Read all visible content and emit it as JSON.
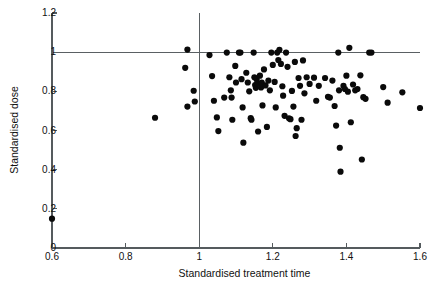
{
  "chart_data": {
    "type": "scatter",
    "title": "",
    "xlabel": "Standardised treatment time",
    "ylabel": "Standardised dose",
    "xlim": [
      0.6,
      1.6
    ],
    "ylim": [
      0,
      1.2
    ],
    "xticks": [
      "0.6",
      "0.8",
      "1",
      "1.2",
      "1.4",
      "1.6"
    ],
    "xtick_values": [
      0.6,
      0.8,
      1.0,
      1.2,
      1.4,
      1.6
    ],
    "yticks": [
      "0",
      "0.2",
      "0.4",
      "0.6",
      "0.8",
      "1",
      "1.2"
    ],
    "ytick_values": [
      0,
      0.2,
      0.4,
      0.6,
      0.8,
      1.0,
      1.2
    ],
    "grid": false,
    "legend": "none",
    "reference_lines": [
      {
        "name": "vertical-reference-line",
        "axis": "x",
        "value": 1.0
      },
      {
        "name": "horizontal-reference-line",
        "axis": "y",
        "value": 1.0
      }
    ],
    "marker": {
      "shape": "circle",
      "color": "#0a0a0a",
      "size": 3.1
    },
    "points": [
      [
        0.6,
        0.15
      ],
      [
        0.88,
        0.665
      ],
      [
        0.962,
        0.92
      ],
      [
        0.968,
        1.013
      ],
      [
        0.968,
        0.722
      ],
      [
        0.985,
        0.803
      ],
      [
        0.988,
        0.748
      ],
      [
        1.028,
        0.985
      ],
      [
        1.035,
        0.878
      ],
      [
        1.04,
        0.752
      ],
      [
        1.048,
        0.667
      ],
      [
        1.052,
        0.597
      ],
      [
        1.068,
        0.768
      ],
      [
        1.075,
        0.998
      ],
      [
        1.082,
        0.872
      ],
      [
        1.086,
        0.805
      ],
      [
        1.088,
        0.768
      ],
      [
        1.09,
        0.655
      ],
      [
        1.098,
        0.93
      ],
      [
        1.1,
        0.845
      ],
      [
        1.108,
        0.998
      ],
      [
        1.112,
        0.998
      ],
      [
        1.115,
        0.862
      ],
      [
        1.118,
        0.718
      ],
      [
        1.12,
        0.538
      ],
      [
        1.128,
        0.895
      ],
      [
        1.132,
        0.845
      ],
      [
        1.136,
        0.8
      ],
      [
        1.14,
        0.663
      ],
      [
        1.142,
        0.655
      ],
      [
        1.148,
        0.998
      ],
      [
        1.15,
        0.872
      ],
      [
        1.152,
        0.832
      ],
      [
        1.154,
        0.818
      ],
      [
        1.156,
        0.862
      ],
      [
        1.158,
        0.842
      ],
      [
        1.16,
        0.595
      ],
      [
        1.165,
        0.88
      ],
      [
        1.168,
        0.82
      ],
      [
        1.17,
        0.845
      ],
      [
        1.172,
        0.728
      ],
      [
        1.176,
        0.912
      ],
      [
        1.18,
        0.83
      ],
      [
        1.184,
        0.618
      ],
      [
        1.188,
        0.855
      ],
      [
        1.192,
        0.805
      ],
      [
        1.196,
        0.998
      ],
      [
        1.2,
        0.935
      ],
      [
        1.205,
        0.848
      ],
      [
        1.208,
        0.718
      ],
      [
        1.212,
        0.998
      ],
      [
        1.215,
        0.96
      ],
      [
        1.218,
        1.012
      ],
      [
        1.222,
        0.94
      ],
      [
        1.226,
        0.826
      ],
      [
        1.228,
        0.778
      ],
      [
        1.232,
        0.675
      ],
      [
        1.236,
        0.998
      ],
      [
        1.24,
        0.925
      ],
      [
        1.244,
        0.662
      ],
      [
        1.248,
        0.658
      ],
      [
        1.252,
        0.802
      ],
      [
        1.256,
        0.722
      ],
      [
        1.26,
        0.95
      ],
      [
        1.262,
        0.572
      ],
      [
        1.265,
        0.612
      ],
      [
        1.27,
        0.868
      ],
      [
        1.274,
        0.828
      ],
      [
        1.278,
        0.655
      ],
      [
        1.282,
        0.958
      ],
      [
        1.286,
        0.79
      ],
      [
        1.292,
        0.872
      ],
      [
        1.3,
        0.838
      ],
      [
        1.312,
        0.87
      ],
      [
        1.318,
        0.752
      ],
      [
        1.325,
        0.828
      ],
      [
        1.342,
        0.868
      ],
      [
        1.35,
        0.772
      ],
      [
        1.355,
        0.768
      ],
      [
        1.362,
        0.855
      ],
      [
        1.368,
        0.725
      ],
      [
        1.372,
        0.625
      ],
      [
        1.378,
        0.998
      ],
      [
        1.38,
        0.805
      ],
      [
        1.382,
        0.512
      ],
      [
        1.384,
        0.39
      ],
      [
        1.392,
        0.828
      ],
      [
        1.396,
        0.812
      ],
      [
        1.4,
        0.88
      ],
      [
        1.404,
        0.798
      ],
      [
        1.408,
        1.022
      ],
      [
        1.412,
        0.642
      ],
      [
        1.418,
        0.835
      ],
      [
        1.424,
        0.805
      ],
      [
        1.43,
        0.812
      ],
      [
        1.438,
        0.882
      ],
      [
        1.442,
        0.452
      ],
      [
        1.446,
        0.77
      ],
      [
        1.452,
        0.762
      ],
      [
        1.462,
        0.998
      ],
      [
        1.468,
        0.998
      ],
      [
        1.5,
        0.822
      ],
      [
        1.512,
        0.742
      ],
      [
        1.552,
        0.795
      ],
      [
        1.6,
        0.715
      ]
    ]
  }
}
